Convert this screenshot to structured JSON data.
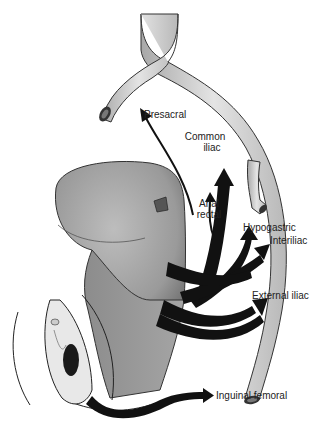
{
  "figure": {
    "labels": {
      "presacral": "Presacral",
      "common_iliac_1": "Common",
      "common_iliac_2": "iliac",
      "anal_rectal_1": "Anal",
      "anal_rectal_2": "rectal",
      "hypogastric": "Hypogastric",
      "interiliac": "Interiliac",
      "external_iliac": "External iliac",
      "inguinal_femoral": "Inguinal femoral"
    },
    "colors": {
      "background": "#ffffff",
      "vessel_fill": "#c9c9c9",
      "organ_fill": "#a9a9a9",
      "arrow_fill": "#111111",
      "text": "#222222"
    }
  }
}
